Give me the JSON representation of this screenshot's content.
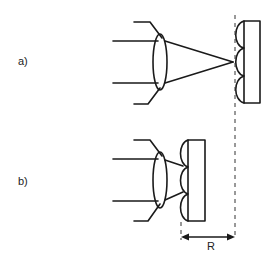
{
  "diagram": {
    "panels": [
      {
        "id": "a",
        "label": "a)"
      },
      {
        "id": "b",
        "label": "b)"
      }
    ],
    "dimension_label": "R",
    "colors": {
      "line": "#1a1a1a",
      "background": "#ffffff"
    }
  }
}
